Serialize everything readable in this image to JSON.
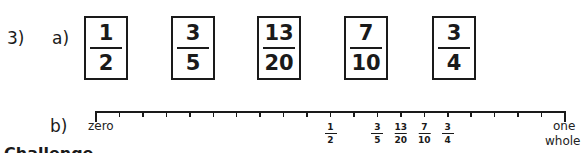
{
  "question": {
    "number": "3)",
    "part_a": {
      "label": "a)",
      "fractions": [
        {
          "num": "1",
          "den": "2",
          "left": 84
        },
        {
          "num": "3",
          "den": "5",
          "left": 171
        },
        {
          "num": "13",
          "den": "20",
          "left": 257
        },
        {
          "num": "7",
          "den": "10",
          "left": 344
        },
        {
          "num": "3",
          "den": "4",
          "left": 432
        }
      ]
    },
    "part_b": {
      "label": "b)",
      "start_label": "zero",
      "end_label_1": "one",
      "end_label_2": "whole",
      "divisions": 20,
      "markers": [
        {
          "num": "1",
          "den": "2",
          "value": 0.5
        },
        {
          "num": "3",
          "den": "5",
          "value": 0.6
        },
        {
          "num": "13",
          "den": "20",
          "value": 0.65
        },
        {
          "num": "7",
          "den": "10",
          "value": 0.7
        },
        {
          "num": "3",
          "den": "4",
          "value": 0.75
        }
      ]
    }
  },
  "cut_off_heading": "Challenge"
}
